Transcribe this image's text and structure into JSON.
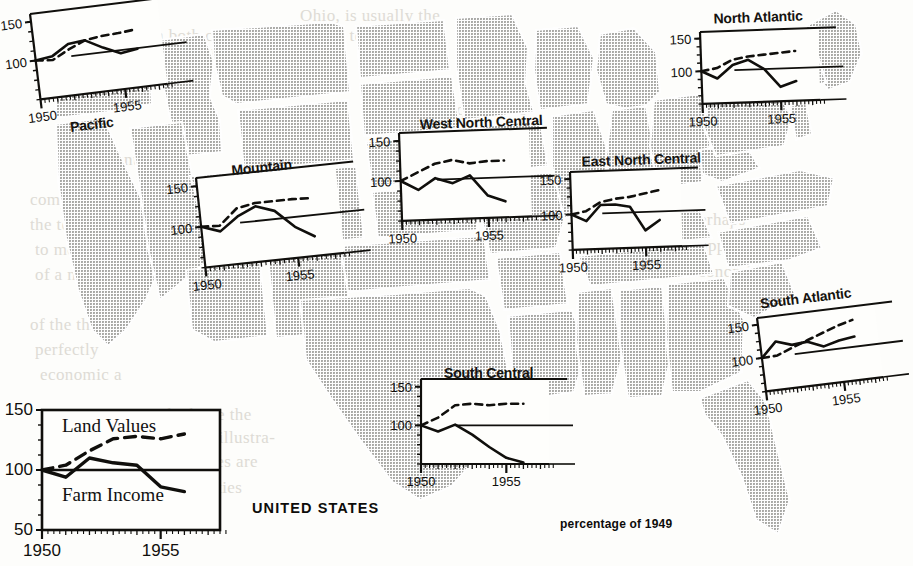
{
  "figure": {
    "units_note": "percentage of 1949",
    "national_label": "UNITED STATES",
    "series": [
      {
        "key": "land_values",
        "label": "Land Values",
        "style": "dashed"
      },
      {
        "key": "farm_income",
        "label": "Farm Income",
        "style": "solid"
      }
    ],
    "baseline": 100
  },
  "background_text": [
    {
      "text": "Ohio, is usually the",
      "x": 300,
      "y": 6
    },
    {
      "text": "in both cases on allotments to dairy",
      "x": 150,
      "y": 26
    },
    {
      "text": "and therefore in the",
      "x": 190,
      "y": 46
    },
    {
      "text": "the quantities",
      "x": 430,
      "y": 100
    },
    {
      "text": "on account the",
      "x": 60,
      "y": 150
    },
    {
      "text": "comparison of",
      "x": 30,
      "y": 190
    },
    {
      "text": "the total price",
      "x": 30,
      "y": 215
    },
    {
      "text": "to measure",
      "x": 35,
      "y": 240
    },
    {
      "text": "of a measure",
      "x": 35,
      "y": 265
    },
    {
      "text": "perhaps",
      "x": 690,
      "y": 210
    },
    {
      "text": "appropriately",
      "x": 700,
      "y": 236
    },
    {
      "text": "economic in",
      "x": 690,
      "y": 262
    },
    {
      "text": "of the three",
      "x": 30,
      "y": 315
    },
    {
      "text": "perfectly",
      "x": 35,
      "y": 340
    },
    {
      "text": "economic a",
      "x": 40,
      "y": 365
    },
    {
      "text": "1917, which are the",
      "x": 110,
      "y": 405
    },
    {
      "text": "part in each illustra-",
      "x": 130,
      "y": 428
    },
    {
      "text": "tion. Series are",
      "x": 150,
      "y": 452
    },
    {
      "text": "commodities",
      "x": 150,
      "y": 478
    }
  ],
  "charts": [
    {
      "id": "pacific",
      "title": "Pacific",
      "title_pos": {
        "x": 56,
        "y": 123
      },
      "frame": {
        "x": 30,
        "y": 14,
        "w": 128,
        "h": 86,
        "rotate": -7
      },
      "y_ticks": [
        {
          "value": 150,
          "label": "150"
        },
        {
          "value": 100,
          "label": "100"
        }
      ],
      "x_ticks": [
        {
          "value": 1950,
          "label": "1950"
        },
        {
          "value": 1955,
          "label": "1955"
        }
      ],
      "chart_data": {
        "type": "line",
        "x": [
          1950,
          1951,
          1952,
          1953,
          1954,
          1955,
          1956
        ],
        "series": [
          {
            "name": "Land Values",
            "values": [
              100,
              98,
              109,
              118,
              121,
              122,
              124
            ]
          },
          {
            "name": "Farm Income",
            "values": [
              100,
              103,
              116,
              118,
              106,
              96,
              99
            ]
          }
        ],
        "ylim": [
          50,
          160
        ],
        "xlim": [
          1950,
          1957.5
        ]
      }
    },
    {
      "id": "mountain",
      "title": "Mountain",
      "title_pos": {
        "x": 232,
        "y": 166
      },
      "frame": {
        "x": 196,
        "y": 178,
        "w": 140,
        "h": 90,
        "rotate": -6
      },
      "y_ticks": [
        {
          "value": 150,
          "label": "150"
        },
        {
          "value": 100,
          "label": "100"
        }
      ],
      "x_ticks": [
        {
          "value": 1950,
          "label": "1950"
        },
        {
          "value": 1955,
          "label": "1955"
        }
      ],
      "chart_data": {
        "type": "line",
        "x": [
          1950,
          1951,
          1952,
          1953,
          1954,
          1955,
          1956
        ],
        "series": [
          {
            "name": "Land Values",
            "values": [
              100,
              99,
              118,
              122,
              122,
              122,
              121
            ]
          },
          {
            "name": "Farm Income",
            "values": [
              100,
              92,
              108,
              118,
              110,
              88,
              74
            ]
          }
        ],
        "ylim": [
          50,
          160
        ],
        "xlim": [
          1950,
          1957.5
        ]
      }
    },
    {
      "id": "west-north-central",
      "title": "West North Central",
      "title_pos": {
        "x": 420,
        "y": 117
      },
      "frame": {
        "x": 399,
        "y": 133,
        "w": 130,
        "h": 88,
        "rotate": -2
      },
      "y_ticks": [
        {
          "value": 150,
          "label": "150"
        },
        {
          "value": 100,
          "label": "100"
        }
      ],
      "x_ticks": [
        {
          "value": 1950,
          "label": "1950"
        },
        {
          "value": 1955,
          "label": "1955"
        }
      ],
      "chart_data": {
        "type": "line",
        "x": [
          1950,
          1951,
          1952,
          1953,
          1954,
          1955,
          1956
        ],
        "series": [
          {
            "name": "Land Values",
            "values": [
              100,
              110,
              120,
              124,
              119,
              121,
              121
            ]
          },
          {
            "name": "Farm Income",
            "values": [
              100,
              88,
              102,
              95,
              104,
              78,
              70
            ]
          }
        ],
        "ylim": [
          50,
          160
        ],
        "xlim": [
          1950,
          1957.5
        ]
      }
    },
    {
      "id": "east-north-central",
      "title": "East North Central",
      "title_pos": {
        "x": 582,
        "y": 154
      },
      "frame": {
        "x": 570,
        "y": 172,
        "w": 110,
        "h": 78,
        "rotate": -2
      },
      "y_ticks": [
        {
          "value": 150,
          "label": "150"
        },
        {
          "value": 100,
          "label": "100"
        }
      ],
      "x_ticks": [
        {
          "value": 1950,
          "label": "1950"
        },
        {
          "value": 1955,
          "label": "1955"
        }
      ],
      "chart_data": {
        "type": "line",
        "x": [
          1950,
          1951,
          1952,
          1953,
          1954,
          1955,
          1956
        ],
        "series": [
          {
            "name": "Land Values",
            "values": [
              100,
              104,
              116,
              120,
              122,
              126,
              130
            ]
          },
          {
            "name": "Farm Income",
            "values": [
              100,
              90,
              112,
              112,
              108,
              74,
              88
            ]
          }
        ],
        "ylim": [
          50,
          160
        ],
        "xlim": [
          1950,
          1957.5
        ]
      }
    },
    {
      "id": "north-atlantic",
      "title": "North Atlantic",
      "title_pos": {
        "x": 714,
        "y": 11
      },
      "frame": {
        "x": 700,
        "y": 32,
        "w": 118,
        "h": 72,
        "rotate": -2
      },
      "y_ticks": [
        {
          "value": 150,
          "label": "150"
        },
        {
          "value": 100,
          "label": "100"
        }
      ],
      "x_ticks": [
        {
          "value": 1950,
          "label": "1950"
        },
        {
          "value": 1955,
          "label": "1955"
        }
      ],
      "chart_data": {
        "type": "line",
        "x": [
          1950,
          1951,
          1952,
          1953,
          1954,
          1955,
          1956
        ],
        "series": [
          {
            "name": "Land Values",
            "values": [
              100,
              104,
              116,
              120,
              122,
              124,
              126
            ]
          },
          {
            "name": "Farm Income",
            "values": [
              100,
              88,
              108,
              115,
              100,
              72,
              80
            ]
          }
        ],
        "ylim": [
          50,
          160
        ],
        "xlim": [
          1950,
          1957.5
        ]
      }
    },
    {
      "id": "south-central",
      "title": "South Central",
      "title_pos": {
        "x": 444,
        "y": 365
      },
      "frame": {
        "x": 421,
        "y": 379,
        "w": 128,
        "h": 85,
        "rotate": 0
      },
      "y_ticks": [
        {
          "value": 150,
          "label": "150"
        },
        {
          "value": 100,
          "label": "100"
        }
      ],
      "x_ticks": [
        {
          "value": 1950,
          "label": "1950"
        },
        {
          "value": 1955,
          "label": "1955"
        }
      ],
      "chart_data": {
        "type": "line",
        "x": [
          1950,
          1951,
          1952,
          1953,
          1954,
          1955,
          1956
        ],
        "series": [
          {
            "name": "Land Values",
            "values": [
              100,
              110,
              126,
              128,
              126,
              128,
              128
            ]
          },
          {
            "name": "Farm Income",
            "values": [
              100,
              92,
              101,
              88,
              72,
              58,
              52
            ]
          }
        ],
        "ylim": [
          50,
          160
        ],
        "xlim": [
          1950,
          1957.5
        ]
      }
    },
    {
      "id": "south-atlantic",
      "title": "South Atlantic",
      "title_pos": {
        "x": 762,
        "y": 296
      },
      "frame": {
        "x": 757,
        "y": 318,
        "w": 118,
        "h": 74,
        "rotate": -7
      },
      "y_ticks": [
        {
          "value": 150,
          "label": "150"
        },
        {
          "value": 100,
          "label": "100"
        }
      ],
      "x_ticks": [
        {
          "value": 1950,
          "label": "1950"
        },
        {
          "value": 1955,
          "label": "1955"
        }
      ],
      "chart_data": {
        "type": "line",
        "x": [
          1950,
          1951,
          1952,
          1953,
          1954,
          1955,
          1956
        ],
        "series": [
          {
            "name": "Land Values",
            "values": [
              100,
              101,
              110,
              118,
              126,
              134,
              140
            ]
          },
          {
            "name": "Farm Income",
            "values": [
              100,
              122,
              114,
              116,
              106,
              112,
              115
            ]
          }
        ],
        "ylim": [
          50,
          160
        ],
        "xlim": [
          1950,
          1957.5
        ]
      }
    },
    {
      "id": "united-states",
      "title": "UNITED STATES",
      "title_pos": {
        "x": 252,
        "y": 500
      },
      "frame": {
        "x": 42,
        "y": 410,
        "w": 178,
        "h": 120,
        "rotate": 0
      },
      "y_ticks": [
        {
          "value": 150,
          "label": "150"
        },
        {
          "value": 100,
          "label": "100"
        },
        {
          "value": 50,
          "label": "50"
        }
      ],
      "x_ticks": [
        {
          "value": 1950,
          "label": "1950"
        },
        {
          "value": 1955,
          "label": "1955"
        }
      ],
      "series_labels": [
        {
          "text": "Land Values",
          "x": 62,
          "y": 415
        },
        {
          "text": "Farm Income",
          "x": 62,
          "y": 484
        }
      ],
      "chart_data": {
        "type": "line",
        "title": "UNITED STATES",
        "xlabel": "",
        "ylabel": "percentage of 1949",
        "x": [
          1950,
          1951,
          1952,
          1953,
          1954,
          1955,
          1956
        ],
        "series": [
          {
            "name": "Land Values",
            "values": [
              100,
              104,
              116,
              126,
              128,
              126,
              130
            ]
          },
          {
            "name": "Farm Income",
            "values": [
              100,
              94,
              110,
              106,
              104,
              86,
              82
            ]
          }
        ],
        "ylim": [
          50,
          150
        ],
        "xlim": [
          1950,
          1957.5
        ],
        "grid": false
      }
    }
  ],
  "axis_values": {
    "y_150": "150",
    "y_100": "100",
    "y_50": "50",
    "x_1950": "1950",
    "x_1955": "1955"
  }
}
